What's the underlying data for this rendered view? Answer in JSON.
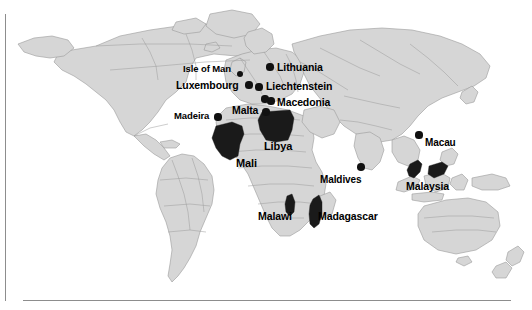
{
  "figure": {
    "name": "world-map-highlighted-countries",
    "background_color": "#ffffff",
    "land_fill": "#d6d6d6",
    "land_stroke": "#9a9a9a",
    "highlight_fill": "#1a1a1a",
    "label_color": "#000000",
    "frame_color": "#8d8d8d"
  },
  "labels": [
    {
      "id": "isle-of-man",
      "text": "Isle of Man",
      "x": 183,
      "y": 64,
      "size": 9.5
    },
    {
      "id": "lithuania",
      "text": "Lithuania",
      "x": 277,
      "y": 62,
      "size": 10.5
    },
    {
      "id": "luxembourg",
      "text": "Luxembourg",
      "x": 176,
      "y": 80,
      "size": 10.5
    },
    {
      "id": "liechtenstein",
      "text": "Liechtenstein",
      "x": 266,
      "y": 81,
      "size": 10.5
    },
    {
      "id": "macedonia",
      "text": "Macedonia",
      "x": 277,
      "y": 97,
      "size": 10.5
    },
    {
      "id": "madeira",
      "text": "Madeira",
      "x": 174,
      "y": 111,
      "size": 9.5
    },
    {
      "id": "malta",
      "text": "Malta",
      "x": 232,
      "y": 105,
      "size": 10.5
    },
    {
      "id": "libya",
      "text": "Libya",
      "x": 264,
      "y": 141,
      "size": 11
    },
    {
      "id": "mali",
      "text": "Mali",
      "x": 236,
      "y": 158,
      "size": 11
    },
    {
      "id": "maldives",
      "text": "Maldives",
      "x": 320,
      "y": 175,
      "size": 10
    },
    {
      "id": "macau",
      "text": "Macau",
      "x": 425,
      "y": 138,
      "size": 10
    },
    {
      "id": "malaysia",
      "text": "Malaysia",
      "x": 406,
      "y": 181,
      "size": 10.5
    },
    {
      "id": "malawi",
      "text": "Malawi",
      "x": 258,
      "y": 211,
      "size": 10.5
    },
    {
      "id": "madagascar",
      "text": "Madagascar",
      "x": 318,
      "y": 211,
      "size": 10.5
    }
  ],
  "markers": [
    {
      "id": "isle-of-man-dot",
      "x": 240,
      "y": 74,
      "r": 3.4
    },
    {
      "id": "lithuania-dot",
      "x": 270,
      "y": 67,
      "r": 3.6
    },
    {
      "id": "luxembourg-dot",
      "x": 249,
      "y": 85,
      "r": 3.6
    },
    {
      "id": "liechtenstein-dot",
      "x": 259,
      "y": 87,
      "r": 3.6
    },
    {
      "id": "macedonia-dot",
      "x": 271,
      "y": 101,
      "r": 3.6
    },
    {
      "id": "madeira-dot",
      "x": 218,
      "y": 117,
      "r": 3.6
    },
    {
      "id": "malta-dot",
      "x": 265,
      "y": 99,
      "r": 3.6
    },
    {
      "id": "malta-dot-2",
      "x": 266,
      "y": 112,
      "r": 3.6
    },
    {
      "id": "maldives-dot",
      "x": 361,
      "y": 167,
      "r": 3.8
    },
    {
      "id": "macau-dot",
      "x": 419,
      "y": 135,
      "r": 3.6
    }
  ],
  "highlighted_regions": [
    {
      "id": "libya-shape",
      "name": "Libya"
    },
    {
      "id": "mali-shape",
      "name": "Mali"
    },
    {
      "id": "malawi-shape",
      "name": "Malawi"
    },
    {
      "id": "madagascar-shape",
      "name": "Madagascar"
    },
    {
      "id": "malaysia-west-shape",
      "name": "Malaysia (Peninsular)"
    },
    {
      "id": "malaysia-east-shape",
      "name": "Malaysia (Borneo)"
    }
  ]
}
